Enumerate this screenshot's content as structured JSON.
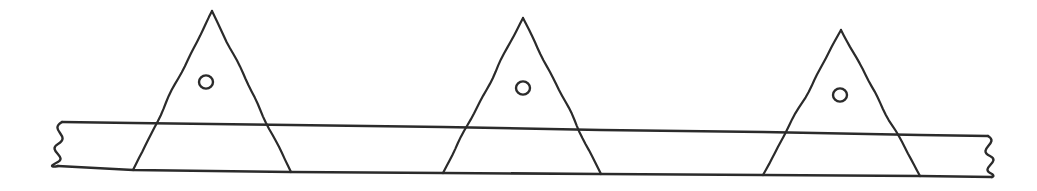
{
  "figure": {
    "kind": "hand-drawn-engineering-sketch",
    "background_color": "#ffffff",
    "ink_color": "#2b2b2b",
    "canvas": {
      "width": 1037,
      "height": 191
    }
  },
  "beam": {
    "name": "horizontal-beam",
    "top_edge": {
      "label": "beam-top-edge",
      "points": "62,122 133,123 291,125 443,127 601,130 763,132 920,135 988,136"
    },
    "bottom_edge": {
      "label": "beam-bottom-edge",
      "points": "58,166 133,170 291,172 443,173 601,174 763,175 920,176 992,177"
    },
    "segments": [
      {
        "name": "segment-left-stub",
        "from_x": 62,
        "to_x": 133
      },
      {
        "name": "segment-between-1-2",
        "from_x": 291,
        "to_x": 443
      },
      {
        "name": "segment-between-2-3",
        "from_x": 601,
        "to_x": 763
      },
      {
        "name": "segment-right-stub",
        "from_x": 920,
        "to_x": 988
      }
    ]
  },
  "breaks": [
    {
      "name": "break-symbol-left",
      "side": "left",
      "wave_count": 4,
      "path": "M62,122 C48,130 72,136 58,144 C46,151 70,157 56,163 C48,167 54,167 58,166"
    },
    {
      "name": "break-symbol-right",
      "side": "right",
      "wave_count": 4,
      "path": "M988,136 C1000,143 976,149 990,156 C1002,162 978,168 992,174 C996,177 990,177 992,177"
    }
  ],
  "triangles": [
    {
      "name": "triangle-1",
      "apex": {
        "x": 212,
        "y": 11
      },
      "base_left": {
        "x": 133,
        "y": 170
      },
      "base_right": {
        "x": 291,
        "y": 172
      },
      "hole": {
        "name": "hole-1",
        "cx": 206,
        "cy": 82,
        "r": 7
      }
    },
    {
      "name": "triangle-2",
      "apex": {
        "x": 523,
        "y": 18
      },
      "base_left": {
        "x": 443,
        "y": 173
      },
      "base_right": {
        "x": 601,
        "y": 174
      },
      "hole": {
        "name": "hole-2",
        "cx": 523,
        "cy": 88,
        "r": 7
      }
    },
    {
      "name": "triangle-3",
      "apex": {
        "x": 841,
        "y": 30
      },
      "base_left": {
        "x": 763,
        "y": 175
      },
      "base_right": {
        "x": 920,
        "y": 176
      },
      "hole": {
        "name": "hole-3",
        "cx": 840,
        "cy": 95,
        "r": 7
      }
    }
  ]
}
